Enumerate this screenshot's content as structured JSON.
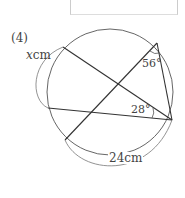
{
  "problem": {
    "number": "(4)",
    "unknown_label": "x cm",
    "unknown_var": "x",
    "unknown_unit": "cm",
    "angle_top": "56°",
    "angle_right": "28°",
    "arc_length": "24cm"
  },
  "colors": {
    "stroke": "#333333",
    "arc": "#777777",
    "text": "#444444"
  }
}
